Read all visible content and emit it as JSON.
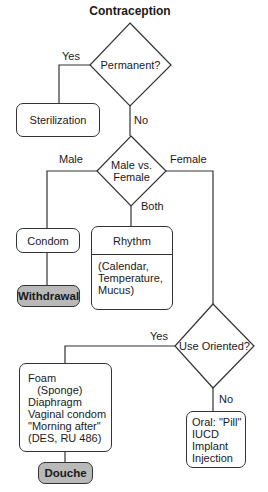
{
  "title": "Contraception",
  "decisions": {
    "permanent": {
      "label": "Permanent?",
      "yes": "Yes",
      "no": "No"
    },
    "sex": {
      "label_line1": "Male vs.",
      "label_line2": "Female",
      "male": "Male",
      "female": "Female",
      "both": "Both"
    },
    "use_oriented": {
      "label": "Use Oriented?",
      "yes": "Yes",
      "no": "No"
    }
  },
  "outcomes": {
    "sterilization": "Sterilization",
    "condom": "Condom",
    "withdrawal": "Withdrawal",
    "rhythm": {
      "heading": "Rhythm",
      "details": [
        "(Calendar,",
        "Temperature,",
        "Mucus)"
      ]
    },
    "barrier": {
      "lines": [
        "Foam",
        "   (Sponge)",
        "Diaphragm",
        "Vaginal condom",
        "\"Morning after\"",
        "(DES, RU 486)"
      ]
    },
    "douche": "Douche",
    "systemic": {
      "lines": [
        "Oral: \"Pill\"",
        "IUCD",
        "Implant",
        "Injection"
      ]
    }
  },
  "colors": {
    "line": "#333333",
    "highlight_fill": "#b9b9b9",
    "background": "#ffffff"
  }
}
